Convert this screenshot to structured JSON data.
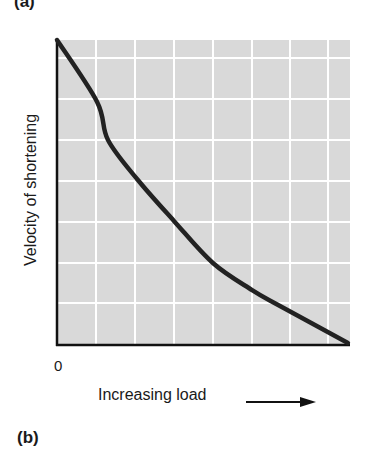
{
  "panels": {
    "top_label": "(a)",
    "bottom_label": "(b)"
  },
  "chart_data": {
    "type": "line",
    "title": "",
    "xlabel": "Increasing load",
    "ylabel": "Velocity of shortening",
    "x_tick_labels": [
      "0"
    ],
    "grid": true,
    "background": "#d9d9d9",
    "grid_color": "#ffffff",
    "line_color": "#222222",
    "xlim": [
      0,
      1
    ],
    "ylim": [
      0,
      1
    ],
    "series": [
      {
        "name": "force-velocity curve",
        "x": [
          0.0,
          0.137,
          0.174,
          0.276,
          0.399,
          0.532,
          0.666,
          0.761,
          0.993
        ],
        "y": [
          1.0,
          0.797,
          0.672,
          0.541,
          0.407,
          0.269,
          0.18,
          0.128,
          0.007
        ]
      }
    ]
  },
  "axis": {
    "origin_label": "0",
    "x_label": "Increasing load",
    "y_label": "Velocity of shortening"
  }
}
